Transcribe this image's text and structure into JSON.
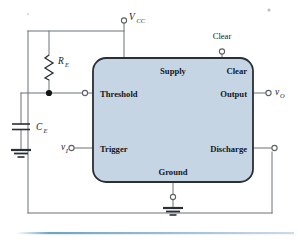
{
  "figure": {
    "type": "circuit-schematic",
    "ic_block": {
      "fill_color": "#c5d5e4",
      "border_color": "#2a2f35",
      "pins": {
        "supply": "Supply",
        "clear": "Clear",
        "threshold": "Threshold",
        "output": "Output",
        "trigger": "Trigger",
        "discharge": "Discharge",
        "ground": "Ground"
      }
    },
    "external_labels": {
      "vcc": "V",
      "vcc_sub": "CC",
      "clear": "Clear",
      "resistor": "R",
      "resistor_sub": "E",
      "capacitor": "C",
      "capacitor_sub": "E",
      "input": "v",
      "input_sub": "I",
      "output": "v",
      "output_sub": "O"
    },
    "colors": {
      "wire": "#6d7278",
      "block_fill": "#c5d5e4",
      "block_stroke": "#2a2f35",
      "rule": "#7fa8c4",
      "component": "#2a2f35"
    },
    "footer_rule": {
      "present": true,
      "color": "#8fb4cd"
    }
  }
}
